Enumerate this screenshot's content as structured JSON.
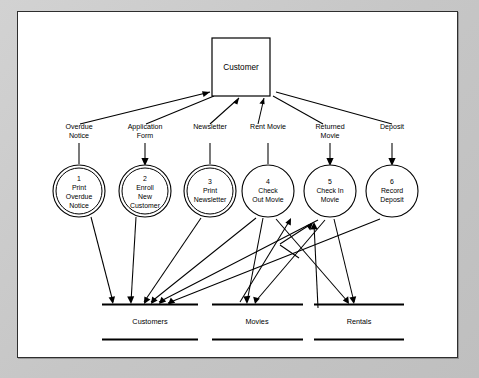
{
  "page": {
    "background_color": "#c9c9c9",
    "sheet_color": "#ffffff",
    "ink_color": "#000000"
  },
  "external_entity": {
    "name": "Customer",
    "label": "Customer"
  },
  "data_flows": [
    {
      "id": "f1",
      "label_line1": "Overdue",
      "label_line2": "Notice",
      "direction": "to-entity"
    },
    {
      "id": "f2",
      "label_line1": "Application",
      "label_line2": "Form",
      "direction": "to-process"
    },
    {
      "id": "f3",
      "label_line1": "Newsletter",
      "label_line2": "",
      "direction": "to-entity"
    },
    {
      "id": "f4",
      "label_line1": "Rent Movie",
      "label_line2": "",
      "direction": "to-process"
    },
    {
      "id": "f5",
      "label_line1": "Returned",
      "label_line2": "Movie",
      "direction": "to-process"
    },
    {
      "id": "f6",
      "label_line1": "Deposit",
      "label_line2": "",
      "direction": "to-process"
    }
  ],
  "processes": [
    {
      "number": "1",
      "line1": "Print",
      "line2": "Overdue",
      "line3": "Notice",
      "double_ring": true
    },
    {
      "number": "2",
      "line1": "Enroll",
      "line2": "New",
      "line3": "Customer",
      "double_ring": true
    },
    {
      "number": "3",
      "line1": "Print",
      "line2": "Newsletter",
      "line3": "",
      "double_ring": true
    },
    {
      "number": "4",
      "line1": "Check",
      "line2": "Out Movie",
      "line3": "",
      "double_ring": false
    },
    {
      "number": "5",
      "line1": "Check In",
      "line2": "Movie",
      "line3": "",
      "double_ring": false
    },
    {
      "number": "6",
      "line1": "Record",
      "line2": "Deposit",
      "line3": "",
      "double_ring": false
    }
  ],
  "data_stores": [
    {
      "label": "Customers"
    },
    {
      "label": "Movies"
    },
    {
      "label": "Rentals"
    }
  ]
}
